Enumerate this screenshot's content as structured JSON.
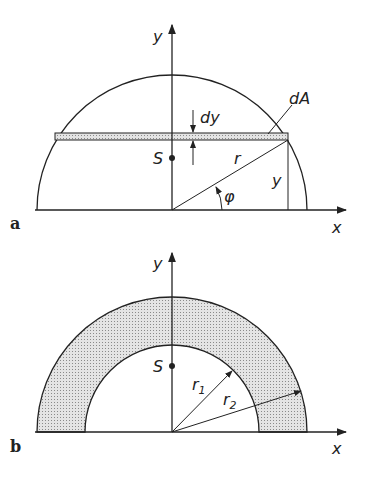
{
  "figure_a": {
    "tag": "a",
    "labels": {
      "y_axis": "y",
      "x_axis": "x",
      "dA": "dA",
      "dy": "dy",
      "S": "S",
      "r": "r",
      "y": "y",
      "phi": "φ"
    }
  },
  "figure_b": {
    "tag": "b",
    "labels": {
      "y_axis": "y",
      "x_axis": "x",
      "S": "S",
      "r1": "r",
      "r1_sub": "1",
      "r2": "r",
      "r2_sub": "2"
    }
  },
  "colors": {
    "line": "#222222",
    "fill": "#cfcfcf"
  }
}
